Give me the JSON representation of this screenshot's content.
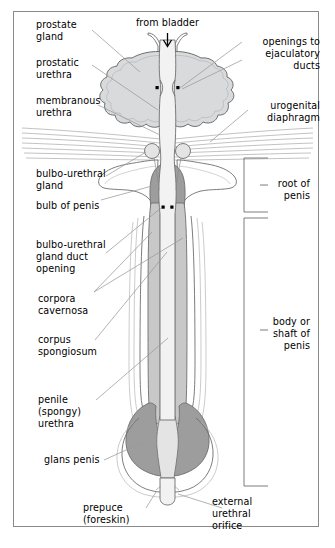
{
  "figure": {
    "type": "anatomical-diagram",
    "orientation": "vertical, superior (bladder) at top, external urethral orifice at bottom",
    "background_color": "#ffffff",
    "border_color": "#8a8a8a",
    "ink_color": "#000000",
    "leader_line_color": "#9a9a9a",
    "outline_color": "#6e6e6e"
  },
  "palette": {
    "prostate_fill": "#d9dadc",
    "crus_fill": "#ffffff",
    "bulb_fill": "#9d9d9d",
    "corpus_cavernosum_fill": "#c8c8c8",
    "corpus_spongiosum_fill": "#dcdcdc",
    "glans_fill": "#9d9d9d",
    "urethra_lumen_fill": "#f2f2f2",
    "skin_fill": "#ffffff",
    "diaphragm_line": "#a8a8a8",
    "duct_opening_marker": "#000000"
  },
  "labels": {
    "top_center": {
      "text": "from bladder",
      "arrow": "down-arrow-icon",
      "align": "center"
    },
    "left": [
      {
        "id": "prostate-gland",
        "text": "prostate\ngland"
      },
      {
        "id": "prostatic-urethra",
        "text": "prostatic\nurethra"
      },
      {
        "id": "membranous-urethra",
        "text": "membranous\nurethra"
      },
      {
        "id": "bulbo-urethral-gland",
        "text": "bulbo-urethral\ngland"
      },
      {
        "id": "bulb-of-penis",
        "text": "bulb of penis"
      },
      {
        "id": "bulbo-urethral-gland-duct-opening",
        "text": "bulbo-urethral\ngland duct\nopening"
      },
      {
        "id": "corpora-cavernosa",
        "text": "corpora\ncavernosa"
      },
      {
        "id": "corpus-spongiosum",
        "text": "corpus\nspongiosum"
      },
      {
        "id": "penile-spongy-urethra",
        "text": "penile\n(spongy)\nurethra"
      },
      {
        "id": "glans-penis",
        "text": "glans penis"
      }
    ],
    "right": [
      {
        "id": "openings-to-ejaculatory-ducts",
        "text": "openings to\nejaculatory\nducts"
      },
      {
        "id": "urogenital-diaphragm",
        "text": "urogenital\ndiaphragm"
      }
    ],
    "brackets": [
      {
        "id": "root-of-penis",
        "text": "root of\npenis",
        "span_top_px": 158,
        "span_bottom_px": 212
      },
      {
        "id": "body-or-shaft-of-penis",
        "text": "body or\nshaft of\npenis",
        "span_top_px": 218,
        "span_bottom_px": 486
      }
    ],
    "bottom": [
      {
        "id": "prepuce-foreskin",
        "text": "prepuce\n(foreskin)",
        "align": "right"
      },
      {
        "id": "external-urethral-orifice",
        "text": "external\nurethral\norifice",
        "align": "left"
      }
    ]
  },
  "markers": {
    "ejaculatory_duct_openings": {
      "count": 2,
      "shape": "square",
      "note": "paired black squares flanking the prostatic urethra"
    },
    "bulbo_urethral_duct_openings": {
      "count": 2,
      "shape": "square",
      "note": "paired black squares flanking the urethra within the bulb"
    }
  }
}
